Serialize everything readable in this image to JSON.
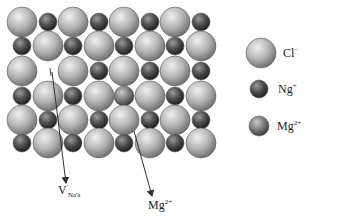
{
  "diagram": {
    "lattice": {
      "columns_x": [
        22,
        48,
        73,
        99,
        124,
        150,
        175,
        201
      ],
      "rows_y": [
        22,
        46,
        71,
        96,
        120,
        143
      ],
      "rows": [
        [
          "Cl",
          "Na",
          "Cl",
          "Na",
          "Cl",
          "Na",
          "Cl",
          "Na"
        ],
        [
          "Na",
          "Cl",
          "Na",
          "Cl",
          "Na",
          "Cl",
          "Na",
          "Cl"
        ],
        [
          "Cl",
          "vacancy",
          "Cl",
          "Na",
          "Cl",
          "Na",
          "Cl",
          "Na"
        ],
        [
          "Na",
          "Cl",
          "Na",
          "Cl",
          "Mg",
          "Cl",
          "Na",
          "Cl"
        ],
        [
          "Cl",
          "Na",
          "Cl",
          "Na",
          "Cl",
          "Na",
          "Cl",
          "Na"
        ],
        [
          "Na",
          "Cl",
          "Na",
          "Cl",
          "Na",
          "Cl",
          "Na",
          "Cl"
        ]
      ]
    },
    "annotations": [
      {
        "label_main": "V",
        "label_sup": "'",
        "label_sub": "Na",
        "label_extra": "'a",
        "x": 58,
        "y": 188
      },
      {
        "label_main": "Mg",
        "label_sup": "2+",
        "x": 148,
        "y": 203
      }
    ],
    "arrows": [
      {
        "x1": 52,
        "y1": 72,
        "x2": 66,
        "y2": 183
      },
      {
        "x1": 134,
        "y1": 131,
        "x2": 152,
        "y2": 196
      }
    ],
    "legend": [
      {
        "species": "Cl",
        "symbol": "Cl",
        "charge": "−",
        "size": "large",
        "cx": 261,
        "cy": 53,
        "r": 15
      },
      {
        "species": "Na",
        "symbol": "Ng",
        "charge": "+",
        "size": "small",
        "cx": 259,
        "cy": 89,
        "r": 9
      },
      {
        "species": "Mg",
        "symbol": "Mg",
        "charge": "2+",
        "size": "medium",
        "cx": 259,
        "cy": 126,
        "r": 10
      }
    ],
    "colors": {
      "cl_light": "#e6e6e6",
      "cl_dark": "#6e6e6e",
      "na_light": "#9a9a9a",
      "na_dark": "#262626",
      "mg_light": "#c0c0c0",
      "mg_dark": "#444444",
      "outline": "#5a5a5a",
      "arrow": "#333333"
    }
  }
}
